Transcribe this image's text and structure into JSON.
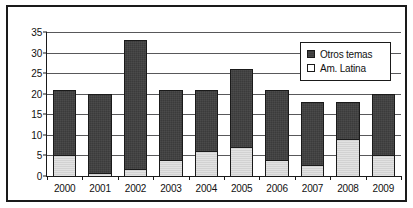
{
  "chart_data": {
    "type": "bar",
    "stacked": true,
    "title": "",
    "subtitle": "",
    "xlabel": "",
    "ylabel": "",
    "categories": [
      "2000",
      "2001",
      "2002",
      "2003",
      "2004",
      "2005",
      "2006",
      "2007",
      "2008",
      "2009"
    ],
    "series": [
      {
        "name": "Am. Latina",
        "color": "#d2d2d2",
        "values": [
          5,
          0.8,
          1.8,
          4,
          6,
          7,
          3.8,
          2.7,
          9,
          5
        ]
      },
      {
        "name": "Otros temas",
        "color": "#3b3b3b",
        "values": [
          16,
          19.2,
          31.2,
          17,
          15,
          19,
          17.2,
          15.3,
          9,
          15
        ]
      }
    ],
    "totals": [
      21,
      20,
      33,
      21,
      21,
      26,
      21,
      18,
      18,
      20
    ],
    "ylim": [
      0,
      35
    ],
    "yticks": [
      0,
      5,
      10,
      15,
      20,
      25,
      30,
      35
    ],
    "ytick_labels": [
      "0",
      "5",
      "10",
      "15",
      "20",
      "25",
      "30",
      "35"
    ],
    "grid": true,
    "legend_position": "top-right"
  },
  "legend": {
    "entries": [
      {
        "label": "Otros temas",
        "swatch": "dark"
      },
      {
        "label": "Am. Latina",
        "swatch": "light"
      }
    ]
  }
}
